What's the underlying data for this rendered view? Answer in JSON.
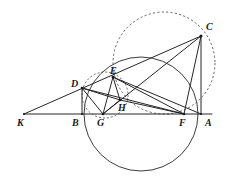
{
  "figure": {
    "width": 226,
    "height": 181,
    "background": "#ffffff",
    "stroke_color": "#262626",
    "dashed_color": "#555555"
  },
  "points": [
    {
      "id": "K",
      "label": "K",
      "x": 24,
      "y": 114,
      "label_x": 17,
      "label_y": 118
    },
    {
      "id": "B",
      "label": "B",
      "x": 82,
      "y": 114,
      "label_x": 72,
      "label_y": 118
    },
    {
      "id": "G",
      "label": "G",
      "x": 103,
      "y": 114,
      "label_x": 97,
      "label_y": 118
    },
    {
      "id": "F",
      "label": "F",
      "x": 184,
      "y": 114,
      "label_x": 179,
      "label_y": 118
    },
    {
      "id": "A",
      "label": "A",
      "x": 201,
      "y": 114,
      "label_x": 205,
      "label_y": 118
    },
    {
      "id": "D",
      "label": "D",
      "x": 82,
      "y": 88,
      "label_x": 71,
      "label_y": 79
    },
    {
      "id": "E",
      "label": "E",
      "x": 113,
      "y": 77,
      "label_x": 110,
      "label_y": 66
    },
    {
      "id": "H",
      "label": "H",
      "x": 120,
      "y": 100,
      "label_x": 118,
      "label_y": 103
    },
    {
      "id": "C",
      "label": "C",
      "x": 201,
      "y": 36,
      "label_x": 206,
      "label_y": 22
    }
  ],
  "segments": [
    {
      "id": "KA",
      "from": "K",
      "to": "A",
      "style": "solid",
      "name": "baseline-k-a"
    },
    {
      "id": "KC",
      "from": "K",
      "to": "C",
      "style": "solid",
      "name": "line-k-through-d-e-to-c"
    },
    {
      "id": "DB",
      "from": "D",
      "to": "B",
      "style": "solid",
      "name": "segment-d-b"
    },
    {
      "id": "DG",
      "from": "D",
      "to": "G",
      "style": "solid",
      "name": "segment-d-g"
    },
    {
      "id": "DH",
      "from": "D",
      "to": "H",
      "style": "solid",
      "name": "segment-d-h"
    },
    {
      "id": "DF",
      "from": "D",
      "to": "F",
      "style": "solid",
      "name": "segment-d-f"
    },
    {
      "id": "EG",
      "from": "E",
      "to": "G",
      "style": "solid",
      "name": "segment-e-g"
    },
    {
      "id": "EH",
      "from": "E",
      "to": "H",
      "style": "solid",
      "name": "segment-e-h"
    },
    {
      "id": "EF",
      "from": "E",
      "to": "F",
      "style": "solid",
      "name": "segment-e-f"
    },
    {
      "id": "EA",
      "from": "E",
      "to": "A",
      "style": "solid",
      "name": "segment-e-a"
    },
    {
      "id": "GH",
      "from": "G",
      "to": "H",
      "style": "solid",
      "name": "segment-g-h"
    },
    {
      "id": "GC",
      "from": "G",
      "to": "C",
      "style": "solid",
      "name": "segment-g-c"
    },
    {
      "id": "HF",
      "from": "H",
      "to": "F",
      "style": "solid",
      "name": "segment-h-f"
    },
    {
      "id": "FC",
      "from": "F",
      "to": "C",
      "style": "solid",
      "name": "segment-f-c"
    },
    {
      "id": "AC",
      "from": "A",
      "to": "C",
      "style": "solid",
      "name": "segment-a-c-vertical"
    }
  ],
  "circles": [
    {
      "id": "big-solid-circle",
      "name": "circumcircle-solid",
      "cx": 141,
      "cy": 114,
      "r": 57,
      "style": "solid",
      "note": "large solid circle through B-region, E, A-region and below baseline"
    },
    {
      "id": "big-dashed-circle",
      "name": "circumcircle-dashed",
      "cx": 164,
      "cy": 63,
      "r": 51,
      "style": "dashed",
      "note": "large dashed circle through C, E and near F"
    },
    {
      "id": "small-dashed-circle",
      "name": "nine-point-circle-dashed",
      "cx": 105,
      "cy": 95,
      "r": 23,
      "style": "dashed",
      "note": "small dashed circle through D, E, G, H"
    }
  ],
  "labels_legend": {
    "K": "K",
    "B": "B",
    "G": "G",
    "F": "F",
    "A": "A",
    "D": "D",
    "E": "E",
    "H": "H",
    "C": "C"
  }
}
